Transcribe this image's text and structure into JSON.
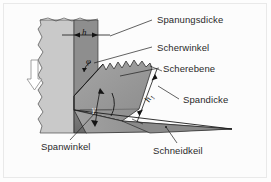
{
  "figure": {
    "domain": "technical-diagram",
    "language": "de",
    "width": 271,
    "height": 182,
    "background_color": "#fcfcfc",
    "frame_color": "#e9e9e9"
  },
  "labels": {
    "spanungsdicke": "Spanungsdicke",
    "scherwinkel": "Scherwinkel",
    "scherebene": "Scherebene",
    "spandicke": "Spandicke",
    "spanwinkel": "Spanwinkel",
    "schneidkeil": "Schneidkeil"
  },
  "symbols": {
    "h": "h",
    "h1_base": "h",
    "h1_sub": "1",
    "phi": "φ",
    "gamma": "γ"
  },
  "parts": {
    "workpiece": {
      "name": "Werkstück",
      "fill": "#c9c9c9"
    },
    "uncut_layer": {
      "name": "Spanungsquerschnitt",
      "fill": "#8e8e8e"
    },
    "chip": {
      "name": "Span",
      "fill": "#9a9a9a"
    },
    "tool_wedge": {
      "name": "Schneidkeil",
      "fill": "#7e7e7e"
    },
    "feed_arrow": {
      "name": "Schnittrichtung",
      "fill": "#ffffff",
      "stroke": "#777777",
      "direction": "down"
    }
  },
  "colors": {
    "line": "#1e1e1e",
    "text": "#2a2a2a",
    "light_gray": "#c9c9c9",
    "mid_gray": "#9a9a9a",
    "dark_gray": "#7e7e7e",
    "darker_gray": "#6f6f6f"
  }
}
